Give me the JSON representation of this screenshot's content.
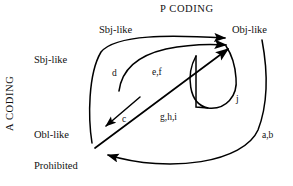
{
  "figure": {
    "axes": {
      "horizontal_title": "P CODING",
      "vertical_title": "A CODING"
    },
    "columns": [
      {
        "id": "col-sbj",
        "label": "Sbj-like"
      },
      {
        "id": "col-obj",
        "label": "Obj-like"
      }
    ],
    "rows": [
      {
        "id": "row-sbj",
        "label": "Sbj-like"
      },
      {
        "id": "row-obl",
        "label": "Obl-like"
      },
      {
        "id": "row-prohibited",
        "label": "Prohibited"
      }
    ],
    "edge_labels": {
      "d": "d",
      "ef": "e,f",
      "c": "c",
      "ghi": "g,h,i",
      "j": "j",
      "ab": "a,b"
    },
    "colors": {
      "background": "#ffffff",
      "ink": "#000000",
      "text": "#111111"
    }
  }
}
